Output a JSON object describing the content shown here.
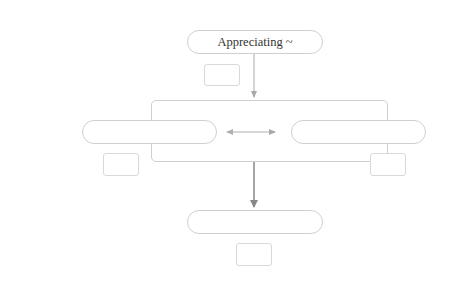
{
  "diagram": {
    "type": "flowchart",
    "colors": {
      "node_border": "#cfcfcf",
      "tag_border": "#d9d9d9",
      "edge_light": "#a8a8a8",
      "edge_dark": "#888888",
      "text": "#333333",
      "background": "#ffffff"
    },
    "nodes": {
      "top": {
        "label": "Appreciating ~"
      },
      "left": {
        "label": ""
      },
      "right": {
        "label": ""
      },
      "bottom": {
        "label": ""
      }
    },
    "tags": {
      "top": {
        "label": ""
      },
      "left": {
        "label": ""
      },
      "right": {
        "label": ""
      },
      "bottom": {
        "label": ""
      }
    },
    "edges": [
      {
        "from": "top",
        "to": "container",
        "style": "arrow"
      },
      {
        "from": "left",
        "to": "right",
        "style": "double-arrow"
      },
      {
        "from": "container",
        "to": "bottom",
        "style": "arrow"
      }
    ]
  }
}
